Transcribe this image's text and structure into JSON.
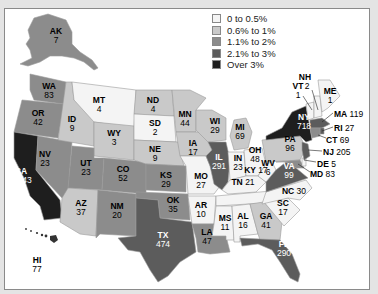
{
  "legend": {
    "items": [
      {
        "label": "0 to 0.5%",
        "color": "#f4f4f4"
      },
      {
        "label": "0.6% to 1%",
        "color": "#c9c9c9"
      },
      {
        "label": "1.1% to 2%",
        "color": "#8c8c8c"
      },
      {
        "label": "2.1% to 3%",
        "color": "#5c5c5c"
      },
      {
        "label": "Over 3%",
        "color": "#1e1e1e"
      }
    ]
  },
  "states": {
    "AK": {
      "abbr": "AK",
      "value": "7"
    },
    "WA": {
      "abbr": "WA",
      "value": "83"
    },
    "OR": {
      "abbr": "OR",
      "value": "42"
    },
    "CA": {
      "abbr": "CA",
      "value": "1,843"
    },
    "ID": {
      "abbr": "ID",
      "value": "9"
    },
    "MT": {
      "abbr": "MT",
      "value": "4"
    },
    "WY": {
      "abbr": "WY",
      "value": "3"
    },
    "NV": {
      "abbr": "NV",
      "value": "23"
    },
    "UT": {
      "abbr": "UT",
      "value": "23"
    },
    "CO": {
      "abbr": "CO",
      "value": "52"
    },
    "AZ": {
      "abbr": "AZ",
      "value": "37"
    },
    "NM": {
      "abbr": "NM",
      "value": "20"
    },
    "ND": {
      "abbr": "ND",
      "value": "4"
    },
    "SD": {
      "abbr": "SD",
      "value": "2"
    },
    "NE": {
      "abbr": "NE",
      "value": "9"
    },
    "KS": {
      "abbr": "KS",
      "value": "29"
    },
    "OK": {
      "abbr": "OK",
      "value": "35"
    },
    "TX": {
      "abbr": "TX",
      "value": "474"
    },
    "MN": {
      "abbr": "MN",
      "value": "44"
    },
    "IA": {
      "abbr": "IA",
      "value": "17"
    },
    "MO": {
      "abbr": "MO",
      "value": "27"
    },
    "AR": {
      "abbr": "AR",
      "value": "10"
    },
    "LA": {
      "abbr": "LA",
      "value": "47"
    },
    "WI": {
      "abbr": "WI",
      "value": "29"
    },
    "IL": {
      "abbr": "IL",
      "value": "291"
    },
    "MI": {
      "abbr": "MI",
      "value": "69"
    },
    "IN": {
      "abbr": "IN",
      "value": "23"
    },
    "OH": {
      "abbr": "OH",
      "value": "48"
    },
    "KY": {
      "abbr": "KY",
      "value": "17"
    },
    "TN": {
      "abbr": "TN",
      "value": "21"
    },
    "MS": {
      "abbr": "MS",
      "value": "11"
    },
    "AL": {
      "abbr": "AL",
      "value": "16"
    },
    "GA": {
      "abbr": "GA",
      "value": "41"
    },
    "FL": {
      "abbr": "FL",
      "value": "290"
    },
    "SC": {
      "abbr": "SC",
      "value": "17"
    },
    "NC": {
      "abbr": "NC",
      "value": "30"
    },
    "VA": {
      "abbr": "VA",
      "value": "99"
    },
    "WV": {
      "abbr": "WV",
      "value": "6"
    },
    "PA": {
      "abbr": "PA",
      "value": "96"
    },
    "NY": {
      "abbr": "NY",
      "value": "718"
    },
    "VT": {
      "abbr": "VT",
      "value": "1"
    },
    "NH": {
      "abbr": "NH",
      "value": "2"
    },
    "ME": {
      "abbr": "ME",
      "value": "1"
    },
    "MA": {
      "abbr": "MA",
      "value": "119"
    },
    "RI": {
      "abbr": "RI",
      "value": "27"
    },
    "CT": {
      "abbr": "CT",
      "value": "69"
    },
    "NJ": {
      "abbr": "NJ",
      "value": "205"
    },
    "DE": {
      "abbr": "DE",
      "value": "5"
    },
    "MD": {
      "abbr": "MD",
      "value": "83"
    },
    "HI": {
      "abbr": "HI",
      "value": "77"
    }
  }
}
